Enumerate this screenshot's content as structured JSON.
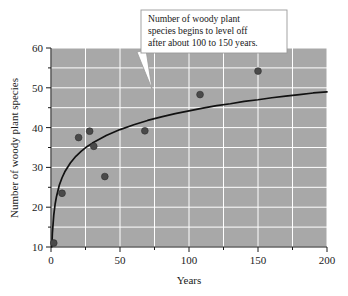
{
  "chart_data": {
    "type": "scatter",
    "title": "",
    "xlabel": "Years",
    "ylabel": "Number of woody plant species",
    "xlim": [
      0,
      200
    ],
    "ylim": [
      10,
      60
    ],
    "x_ticks": [
      0,
      50,
      100,
      150,
      200
    ],
    "x_tick_labels": [
      "0",
      "50",
      "100",
      "150",
      "200"
    ],
    "x_minor_step": 25,
    "y_ticks": [
      10,
      20,
      30,
      40,
      50,
      60
    ],
    "y_tick_labels": [
      "10",
      "20",
      "30",
      "40",
      "50",
      "60"
    ],
    "y_minor_step": 5,
    "grid": true,
    "grid_color": "#ffffff",
    "plot_bgcolor": "#a8a8a8",
    "figure_bgcolor": "#ffffff",
    "legend": null,
    "series": [
      {
        "name": "Observed sites",
        "type": "scatter",
        "marker_color": "#4a4a4a",
        "points": [
          {
            "x": 2,
            "y": 11.0
          },
          {
            "x": 8,
            "y": 23.5
          },
          {
            "x": 20,
            "y": 37.5
          },
          {
            "x": 28,
            "y": 39.1
          },
          {
            "x": 31,
            "y": 35.3
          },
          {
            "x": 39,
            "y": 27.7
          },
          {
            "x": 68,
            "y": 39.2
          },
          {
            "x": 108,
            "y": 48.3
          },
          {
            "x": 150,
            "y": 54.2
          }
        ]
      },
      {
        "name": "Logarithmic fit",
        "type": "line",
        "line_color": "#111111",
        "model": "logarithmic",
        "points": [
          {
            "x": 0.6,
            "y": 10.0
          },
          {
            "x": 1,
            "y": 13.5
          },
          {
            "x": 2,
            "y": 18.0
          },
          {
            "x": 3,
            "y": 20.8
          },
          {
            "x": 4,
            "y": 22.7
          },
          {
            "x": 6,
            "y": 25.5
          },
          {
            "x": 8,
            "y": 27.4
          },
          {
            "x": 10,
            "y": 28.9
          },
          {
            "x": 14,
            "y": 31.1
          },
          {
            "x": 18,
            "y": 32.8
          },
          {
            "x": 22,
            "y": 34.1
          },
          {
            "x": 26,
            "y": 35.2
          },
          {
            "x": 30,
            "y": 36.1
          },
          {
            "x": 40,
            "y": 38.0
          },
          {
            "x": 50,
            "y": 39.5
          },
          {
            "x": 60,
            "y": 40.7
          },
          {
            "x": 70,
            "y": 41.8
          },
          {
            "x": 80,
            "y": 42.7
          },
          {
            "x": 90,
            "y": 43.5
          },
          {
            "x": 100,
            "y": 44.2
          },
          {
            "x": 110,
            "y": 44.9
          },
          {
            "x": 120,
            "y": 45.5
          },
          {
            "x": 130,
            "y": 46.0
          },
          {
            "x": 140,
            "y": 46.6
          },
          {
            "x": 150,
            "y": 47.0
          },
          {
            "x": 160,
            "y": 47.5
          },
          {
            "x": 170,
            "y": 47.9
          },
          {
            "x": 180,
            "y": 48.3
          },
          {
            "x": 190,
            "y": 48.7
          },
          {
            "x": 200,
            "y": 49.0
          }
        ]
      }
    ],
    "annotations": [
      {
        "name": "callout",
        "lines": [
          "Number of woody plant",
          "species begins to level off",
          "after about 100 to 150 years."
        ],
        "points_to": {
          "x": 108,
          "y": 49.5
        }
      }
    ]
  }
}
